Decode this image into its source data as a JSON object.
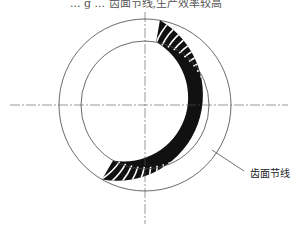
{
  "header": {
    "partial_text": "... g ... 齿面节线,生产效率较高"
  },
  "diagram": {
    "center": [
      145,
      105
    ],
    "outer_radius": 86,
    "inner_radius": 64,
    "toothed_arc_start_deg": -80,
    "toothed_arc_end_deg": 120,
    "label": "齿面节线",
    "line_color": "#333333",
    "tooth_color": "#111111"
  }
}
